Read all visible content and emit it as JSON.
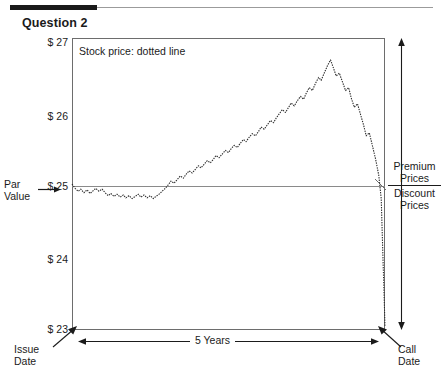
{
  "header": {
    "title": "Question 2"
  },
  "chart_note": "Stock price: dotted line",
  "axis": {
    "y_ticks": [
      "$ 27",
      "$ 26",
      "$ 25",
      "$ 24",
      "$ 23"
    ],
    "y_tick_values": [
      27,
      26,
      25,
      24,
      23
    ],
    "ylim": [
      23,
      27
    ],
    "x_span_label": "5 Years",
    "x_start_label_line1": "Issue",
    "x_start_label_line2": "Date",
    "x_end_label_line1": "Call",
    "x_end_label_line2": "Date"
  },
  "annotations": {
    "par_label_line1": "Par",
    "par_label_line2": "Value",
    "par_value": 25,
    "premium_line1": "Premium",
    "premium_line2": "Prices",
    "discount_line1": "Discount",
    "discount_line2": "Prices"
  },
  "colors": {
    "frame": "#6d6d6d",
    "par_line": "#8a8a8a",
    "series": "#2b2b2b",
    "rule_dark": "#1a1a1a",
    "rule_light": "#9b9b9b",
    "text": "#1b1b1b"
  },
  "chart_data": {
    "type": "line",
    "title": "Question 2",
    "subtitle": "Stock price: dotted line",
    "xlabel": "5 Years",
    "ylabel": "",
    "ylim": [
      23,
      27
    ],
    "xlim": [
      0,
      5
    ],
    "grid": false,
    "legend": "none",
    "y_tick_labels": [
      "$ 27",
      "$ 26",
      "$ 25",
      "$ 24",
      "$ 23"
    ],
    "y_tick_values": [
      27,
      26,
      25,
      24,
      23
    ],
    "reference_lines": [
      {
        "y": 25,
        "label": "Par Value",
        "style": "solid"
      }
    ],
    "series": [
      {
        "name": "Stock price",
        "style": "dotted",
        "x": [
          0.0,
          0.05,
          0.1,
          0.14,
          0.19,
          0.24,
          0.29,
          0.34,
          0.38,
          0.43,
          0.48,
          0.53,
          0.58,
          0.62,
          0.67,
          0.72,
          0.77,
          0.82,
          0.86,
          0.91,
          0.96,
          1.01,
          1.06,
          1.1,
          1.15,
          1.2,
          1.25,
          1.3,
          1.34,
          1.39,
          1.44,
          1.49,
          1.54,
          1.58,
          1.63,
          1.68,
          1.73,
          1.78,
          1.82,
          1.87,
          1.92,
          1.97,
          2.02,
          2.06,
          2.11,
          2.16,
          2.21,
          2.26,
          2.3,
          2.35,
          2.4,
          2.45,
          2.5,
          2.54,
          2.59,
          2.64,
          2.69,
          2.74,
          2.78,
          2.83,
          2.88,
          2.93,
          2.98,
          3.02,
          3.07,
          3.12,
          3.17,
          3.22,
          3.26,
          3.31,
          3.36,
          3.41,
          3.46,
          3.5,
          3.55,
          3.6,
          3.65,
          3.7,
          3.74,
          3.79,
          3.84,
          3.89,
          3.94,
          3.98,
          4.03,
          4.08,
          4.13,
          4.18,
          4.22,
          4.27,
          4.32,
          4.37,
          4.42,
          4.46,
          4.51,
          4.56,
          4.61,
          4.66,
          4.7,
          4.75,
          4.8,
          4.85,
          4.9,
          4.94,
          5.0
        ],
        "y": [
          25.0,
          24.94,
          24.9,
          24.93,
          24.88,
          24.92,
          24.87,
          24.91,
          24.94,
          24.9,
          24.93,
          24.88,
          24.84,
          24.87,
          24.83,
          24.86,
          24.82,
          24.85,
          24.81,
          24.84,
          24.8,
          24.83,
          24.86,
          24.82,
          24.85,
          24.81,
          24.84,
          24.8,
          24.83,
          24.86,
          24.9,
          24.94,
          24.99,
          25.04,
          25.01,
          25.06,
          25.11,
          25.08,
          25.13,
          25.18,
          25.15,
          25.2,
          25.25,
          25.22,
          25.27,
          25.32,
          25.29,
          25.34,
          25.39,
          25.36,
          25.41,
          25.46,
          25.43,
          25.48,
          25.53,
          25.5,
          25.56,
          25.61,
          25.58,
          25.64,
          25.69,
          25.66,
          25.72,
          25.78,
          25.75,
          25.81,
          25.87,
          25.84,
          25.9,
          25.96,
          26.02,
          25.98,
          26.05,
          26.11,
          26.07,
          26.14,
          26.2,
          26.16,
          26.24,
          26.32,
          26.28,
          26.38,
          26.46,
          26.42,
          26.52,
          26.62,
          26.7,
          26.58,
          26.48,
          26.52,
          26.4,
          26.28,
          26.32,
          26.18,
          26.05,
          26.1,
          25.95,
          25.8,
          25.66,
          25.7,
          25.52,
          25.34,
          25.12,
          24.8,
          23.05
        ]
      }
    ]
  }
}
